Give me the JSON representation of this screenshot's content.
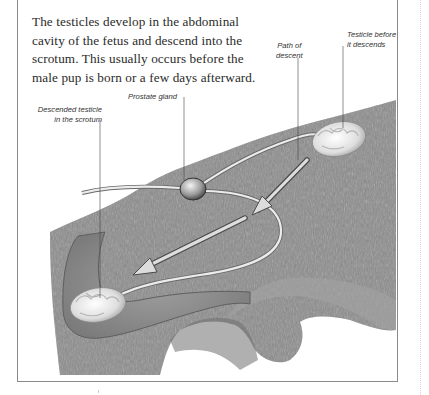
{
  "caption": "The testicles develop in the abdominal cavity of the fetus and descend into the scrotum. This usually occurs before the male pup is born or a few days afterward.",
  "labels": {
    "path_of_descent": [
      "Path of",
      "descent"
    ],
    "testicle_before": [
      "Testicle before",
      "it descends"
    ],
    "prostate_gland": "Prostate gland",
    "descended_testicle": [
      "Descended testicle",
      "in the scrotum"
    ]
  },
  "colors": {
    "fur": "#8c8c8c",
    "fur_dark": "#6e6e6e",
    "duct": "#e8e8e8",
    "arrow_fill": "#dcdcdc",
    "frame": "#8a8a8a",
    "text": "#2a2a2a"
  }
}
